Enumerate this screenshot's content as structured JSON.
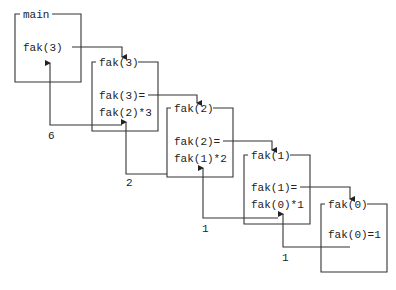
{
  "diagram": {
    "frames": [
      {
        "id": "main",
        "header": "main",
        "line1": "fak(3)",
        "line2": ""
      },
      {
        "id": "fak3",
        "header": "fak(3)",
        "line1": "fak(3)=",
        "line2": "fak(2)*3"
      },
      {
        "id": "fak2",
        "header": "fak(2)",
        "line1": "fak(2)=",
        "line2": "fak(1)*2"
      },
      {
        "id": "fak1",
        "header": "fak(1)",
        "line1": "fak(1)=",
        "line2": "fak(0)*1"
      },
      {
        "id": "fak0",
        "header": "fak(0)",
        "line1": "fak(0)=1",
        "line2": ""
      }
    ],
    "return_values": [
      "6",
      "2",
      "1",
      "1"
    ]
  }
}
